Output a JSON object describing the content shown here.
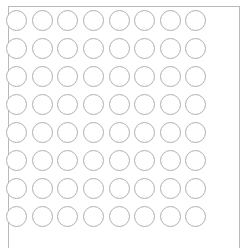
{
  "panel": {
    "name": "circle-grid-panel",
    "shape_label": "circle",
    "rows": 8,
    "columns": 8,
    "total_circles": 64,
    "background_color": "#ffffff",
    "frame_color": "#b9b9b9",
    "circle_stroke_color": "#b0b0b0",
    "circle_fill_color": "#ffffff",
    "circle_diameter_px": 21,
    "cell_pitch_x_px": 28,
    "cell_pitch_y_px": 28
  },
  "grid": {
    "cells": [
      {
        "row": 1,
        "col": 1,
        "label": ""
      },
      {
        "row": 1,
        "col": 2,
        "label": ""
      },
      {
        "row": 1,
        "col": 3,
        "label": ""
      },
      {
        "row": 1,
        "col": 4,
        "label": ""
      },
      {
        "row": 1,
        "col": 5,
        "label": ""
      },
      {
        "row": 1,
        "col": 6,
        "label": ""
      },
      {
        "row": 1,
        "col": 7,
        "label": ""
      },
      {
        "row": 1,
        "col": 8,
        "label": ""
      },
      {
        "row": 2,
        "col": 1,
        "label": ""
      },
      {
        "row": 2,
        "col": 2,
        "label": ""
      },
      {
        "row": 2,
        "col": 3,
        "label": ""
      },
      {
        "row": 2,
        "col": 4,
        "label": ""
      },
      {
        "row": 2,
        "col": 5,
        "label": ""
      },
      {
        "row": 2,
        "col": 6,
        "label": ""
      },
      {
        "row": 2,
        "col": 7,
        "label": ""
      },
      {
        "row": 2,
        "col": 8,
        "label": ""
      },
      {
        "row": 3,
        "col": 1,
        "label": ""
      },
      {
        "row": 3,
        "col": 2,
        "label": ""
      },
      {
        "row": 3,
        "col": 3,
        "label": ""
      },
      {
        "row": 3,
        "col": 4,
        "label": ""
      },
      {
        "row": 3,
        "col": 5,
        "label": ""
      },
      {
        "row": 3,
        "col": 6,
        "label": ""
      },
      {
        "row": 3,
        "col": 7,
        "label": ""
      },
      {
        "row": 3,
        "col": 8,
        "label": ""
      },
      {
        "row": 4,
        "col": 1,
        "label": ""
      },
      {
        "row": 4,
        "col": 2,
        "label": ""
      },
      {
        "row": 4,
        "col": 3,
        "label": ""
      },
      {
        "row": 4,
        "col": 4,
        "label": ""
      },
      {
        "row": 4,
        "col": 5,
        "label": ""
      },
      {
        "row": 4,
        "col": 6,
        "label": ""
      },
      {
        "row": 4,
        "col": 7,
        "label": ""
      },
      {
        "row": 4,
        "col": 8,
        "label": ""
      },
      {
        "row": 5,
        "col": 1,
        "label": ""
      },
      {
        "row": 5,
        "col": 2,
        "label": ""
      },
      {
        "row": 5,
        "col": 3,
        "label": ""
      },
      {
        "row": 5,
        "col": 4,
        "label": ""
      },
      {
        "row": 5,
        "col": 5,
        "label": ""
      },
      {
        "row": 5,
        "col": 6,
        "label": ""
      },
      {
        "row": 5,
        "col": 7,
        "label": ""
      },
      {
        "row": 5,
        "col": 8,
        "label": ""
      },
      {
        "row": 6,
        "col": 1,
        "label": ""
      },
      {
        "row": 6,
        "col": 2,
        "label": ""
      },
      {
        "row": 6,
        "col": 3,
        "label": ""
      },
      {
        "row": 6,
        "col": 4,
        "label": ""
      },
      {
        "row": 6,
        "col": 5,
        "label": ""
      },
      {
        "row": 6,
        "col": 6,
        "label": ""
      },
      {
        "row": 6,
        "col": 7,
        "label": ""
      },
      {
        "row": 6,
        "col": 8,
        "label": ""
      },
      {
        "row": 7,
        "col": 1,
        "label": ""
      },
      {
        "row": 7,
        "col": 2,
        "label": ""
      },
      {
        "row": 7,
        "col": 3,
        "label": ""
      },
      {
        "row": 7,
        "col": 4,
        "label": ""
      },
      {
        "row": 7,
        "col": 5,
        "label": ""
      },
      {
        "row": 7,
        "col": 6,
        "label": ""
      },
      {
        "row": 7,
        "col": 7,
        "label": ""
      },
      {
        "row": 7,
        "col": 8,
        "label": ""
      },
      {
        "row": 8,
        "col": 1,
        "label": ""
      },
      {
        "row": 8,
        "col": 2,
        "label": ""
      },
      {
        "row": 8,
        "col": 3,
        "label": ""
      },
      {
        "row": 8,
        "col": 4,
        "label": ""
      },
      {
        "row": 8,
        "col": 5,
        "label": ""
      },
      {
        "row": 8,
        "col": 6,
        "label": ""
      },
      {
        "row": 8,
        "col": 7,
        "label": ""
      },
      {
        "row": 8,
        "col": 8,
        "label": ""
      }
    ]
  }
}
